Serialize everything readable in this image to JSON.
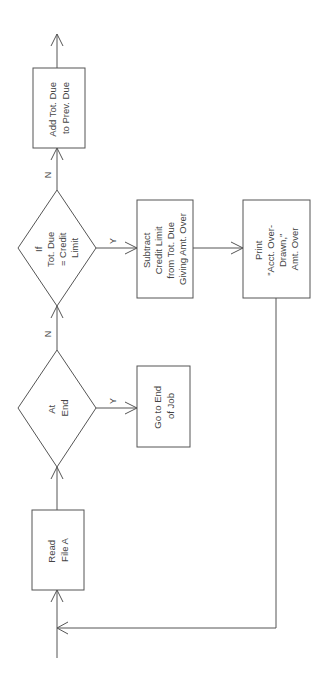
{
  "diagram": {
    "type": "flowchart",
    "orientation": "rotated-90-ccw",
    "nodes": {
      "read_file": {
        "shape": "process",
        "lines": [
          "Read",
          "File A"
        ]
      },
      "at_end": {
        "shape": "decision",
        "lines": [
          "At",
          "End"
        ]
      },
      "go_to_end": {
        "shape": "process",
        "lines": [
          "Go to End",
          "of Job"
        ]
      },
      "if_credit": {
        "shape": "decision",
        "lines": [
          "If",
          "Tot. Due",
          "= Credit",
          "Limit"
        ]
      },
      "subtract": {
        "shape": "process",
        "lines": [
          "Subtract",
          "Credit Limit",
          "from Tot. Due",
          "Giving Amt. Over"
        ]
      },
      "print": {
        "shape": "process",
        "lines": [
          "Print",
          "\"Acct. Over-",
          "Drawn,\"",
          "Amt. Over"
        ]
      },
      "add_due": {
        "shape": "process",
        "lines": [
          "Add Tot. Due",
          "to Prev. Due"
        ]
      }
    },
    "edge_labels": {
      "at_end_no": "N",
      "at_end_yes": "Y",
      "if_credit_no": "N",
      "if_credit_yes": "Y"
    },
    "edges": [
      {
        "from": "entry",
        "to": "read_file"
      },
      {
        "from": "read_file",
        "to": "at_end"
      },
      {
        "from": "at_end",
        "to": "go_to_end",
        "label": "Y"
      },
      {
        "from": "at_end",
        "to": "if_credit",
        "label": "N"
      },
      {
        "from": "if_credit",
        "to": "subtract",
        "label": "Y"
      },
      {
        "from": "if_credit",
        "to": "add_due",
        "label": "N"
      },
      {
        "from": "subtract",
        "to": "print"
      },
      {
        "from": "print",
        "to": "read_file",
        "note": "loop back"
      },
      {
        "from": "add_due",
        "to": "exit"
      }
    ]
  },
  "colors": {
    "line": "#555555",
    "text": "#444444",
    "background": "#ffffff"
  }
}
